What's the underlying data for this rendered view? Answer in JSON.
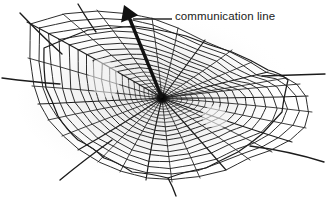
{
  "figure": {
    "kind": "spider-web-diagram",
    "background_color": "#ffffff",
    "ink_color": "#151515",
    "halo_color": "#ebebeb"
  },
  "annotation": {
    "label": "communication line",
    "label_color": "#1a1a1a",
    "leader_line": {
      "x1": 133,
      "y1": 19,
      "x2": 172,
      "y2": 19,
      "color": "#2b2b2b"
    },
    "arrow": {
      "name": "communication-line-arrow",
      "tip": {
        "x": 124,
        "y": 5
      },
      "tail": {
        "x": 162,
        "y": 98
      },
      "color": "#111111",
      "shaft_width_px": 3.4,
      "head_length_px": 15
    }
  },
  "web": {
    "hub": {
      "x": 162,
      "y": 98
    },
    "hub_blob_radius": 7,
    "radial_count": 30,
    "spiral_ring_count": 22,
    "radials_end_points": [
      [
        27,
        22
      ],
      [
        63,
        14
      ],
      [
        97,
        10
      ],
      [
        128,
        12
      ],
      [
        152,
        18
      ],
      [
        178,
        28
      ],
      [
        205,
        40
      ],
      [
        232,
        50
      ],
      [
        252,
        62
      ],
      [
        268,
        72
      ],
      [
        286,
        78
      ],
      [
        300,
        84
      ],
      [
        308,
        96
      ],
      [
        312,
        112
      ],
      [
        306,
        128
      ],
      [
        292,
        142
      ],
      [
        272,
        152
      ],
      [
        250,
        160
      ],
      [
        226,
        170
      ],
      [
        200,
        178
      ],
      [
        172,
        182
      ],
      [
        146,
        180
      ],
      [
        120,
        172
      ],
      [
        98,
        162
      ],
      [
        78,
        150
      ],
      [
        62,
        136
      ],
      [
        48,
        120
      ],
      [
        38,
        104
      ],
      [
        32,
        86
      ],
      [
        28,
        58
      ]
    ],
    "frame_polygon": [
      [
        44,
        48
      ],
      [
        88,
        30
      ],
      [
        134,
        26
      ],
      [
        186,
        36
      ],
      [
        232,
        52
      ],
      [
        268,
        70
      ],
      [
        288,
        80
      ],
      [
        282,
        112
      ],
      [
        262,
        134
      ],
      [
        238,
        152
      ],
      [
        206,
        168
      ],
      [
        168,
        178
      ],
      [
        132,
        172
      ],
      [
        104,
        158
      ],
      [
        78,
        140
      ],
      [
        58,
        116
      ],
      [
        46,
        88
      ]
    ],
    "anchor_lines": [
      {
        "name": "anchor-left-long",
        "from": [
          60,
          84
        ],
        "to": [
          2,
          78
        ]
      },
      {
        "name": "anchor-right-long",
        "from": [
          262,
          76
        ],
        "to": [
          325,
          74
        ]
      },
      {
        "name": "anchor-upper-left-a",
        "from": [
          62,
          54
        ],
        "to": [
          20,
          13
        ]
      },
      {
        "name": "anchor-upper-left-b",
        "from": [
          96,
          32
        ],
        "to": [
          78,
          4
        ]
      },
      {
        "name": "anchor-lower-left",
        "from": [
          112,
          140
        ],
        "to": [
          60,
          180
        ]
      },
      {
        "name": "anchor-lower-right",
        "from": [
          250,
          146
        ],
        "to": [
          324,
          162
        ]
      },
      {
        "name": "anchor-bottom",
        "from": [
          168,
          178
        ],
        "to": [
          176,
          196
        ]
      }
    ]
  }
}
